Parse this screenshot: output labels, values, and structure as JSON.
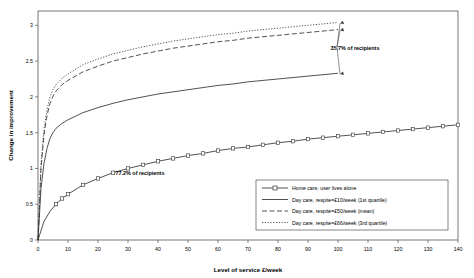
{
  "chart_data": {
    "type": "line",
    "title": "",
    "xlabel": "Level of service £/week",
    "ylabel": "Change in improvement",
    "xlim": [
      0,
      140
    ],
    "ylim": [
      0,
      3.2
    ],
    "xticks": [
      "0",
      "10",
      "20",
      "30",
      "40",
      "50",
      "60",
      "70",
      "80",
      "90",
      "100",
      "110",
      "120",
      "130",
      "140"
    ],
    "yticks": [
      "0",
      "0.5",
      "1",
      "1.5",
      "2",
      "2.5",
      "3"
    ],
    "grid": false,
    "legend_position": "bottom-right",
    "series": [
      {
        "name": "Home care, user lives alone",
        "style": "solid-square-markers",
        "x": [
          0,
          2,
          4,
          6,
          8,
          10,
          15,
          20,
          25,
          30,
          35,
          40,
          45,
          50,
          55,
          60,
          65,
          70,
          75,
          80,
          85,
          90,
          95,
          100,
          105,
          110,
          115,
          120,
          125,
          130,
          135,
          140
        ],
        "y": [
          0,
          0.26,
          0.4,
          0.5,
          0.58,
          0.64,
          0.77,
          0.86,
          0.94,
          1.0,
          1.05,
          1.1,
          1.14,
          1.18,
          1.21,
          1.25,
          1.28,
          1.3,
          1.33,
          1.36,
          1.38,
          1.41,
          1.43,
          1.45,
          1.47,
          1.49,
          1.51,
          1.53,
          1.55,
          1.57,
          1.59,
          1.61
        ]
      },
      {
        "name": "Day care, respite=£10/week (1st quartile)",
        "style": "solid",
        "x": [
          0,
          1,
          2,
          3,
          4,
          5,
          6,
          8,
          10,
          15,
          20,
          25,
          30,
          35,
          40,
          45,
          50,
          55,
          60,
          65,
          70,
          75,
          80,
          85,
          90,
          95,
          100
        ],
        "y": [
          0,
          0.72,
          1.07,
          1.28,
          1.42,
          1.5,
          1.56,
          1.63,
          1.68,
          1.78,
          1.85,
          1.91,
          1.96,
          2.0,
          2.04,
          2.07,
          2.1,
          2.13,
          2.16,
          2.18,
          2.21,
          2.23,
          2.25,
          2.27,
          2.29,
          2.31,
          2.33
        ]
      },
      {
        "name": "Day care, respite=£50/week (mean)",
        "style": "dashed",
        "x": [
          0,
          1,
          2,
          3,
          4,
          5,
          6,
          8,
          10,
          15,
          20,
          25,
          30,
          35,
          40,
          45,
          50,
          55,
          60,
          65,
          70,
          75,
          80,
          85,
          90,
          95,
          100
        ],
        "y": [
          0,
          1.0,
          1.47,
          1.74,
          1.91,
          2.01,
          2.08,
          2.17,
          2.23,
          2.35,
          2.43,
          2.5,
          2.55,
          2.6,
          2.64,
          2.68,
          2.71,
          2.74,
          2.77,
          2.79,
          2.82,
          2.84,
          2.86,
          2.88,
          2.9,
          2.92,
          2.94
        ]
      },
      {
        "name": "Day care, respite=£66/week (3rd quartile)",
        "style": "dotted",
        "x": [
          0,
          1,
          2,
          3,
          4,
          5,
          6,
          8,
          10,
          15,
          20,
          25,
          30,
          35,
          40,
          45,
          50,
          55,
          60,
          65,
          70,
          75,
          80,
          85,
          90,
          95,
          100
        ],
        "y": [
          0,
          1.07,
          1.55,
          1.82,
          2.0,
          2.1,
          2.17,
          2.26,
          2.32,
          2.45,
          2.53,
          2.6,
          2.65,
          2.7,
          2.74,
          2.78,
          2.81,
          2.84,
          2.87,
          2.89,
          2.92,
          2.94,
          2.96,
          2.98,
          3.0,
          3.02,
          3.04
        ]
      }
    ],
    "annotations": [
      {
        "text": "35.7% of recipients",
        "x_px": 355,
        "y_px": 50
      },
      {
        "text": "77.2% of recipients",
        "x_px": 140,
        "y_px": 175
      }
    ]
  },
  "legend": {
    "entries": [
      {
        "label": "Home care, user lives alone",
        "marker": "square"
      },
      {
        "label": "Day care, respite=£10/week (1st quartile)",
        "marker": "solid-line"
      },
      {
        "label": "Day care, respite=£50/week (mean)",
        "marker": "dashed-line"
      },
      {
        "label": "Day care, respite=£66/week (3rd quartile)",
        "marker": "dotted-line"
      }
    ]
  },
  "colors": {
    "line": "#333333",
    "frame": "#555555",
    "text": "#000000",
    "background": "#ffffff"
  }
}
